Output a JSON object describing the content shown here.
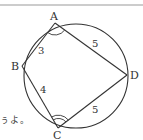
{
  "diagram": {
    "vertices": {
      "A": {
        "label": "A",
        "x": 55,
        "y": 23
      },
      "B": {
        "label": "B",
        "x": 22,
        "y": 66
      },
      "C": {
        "label": "C",
        "x": 58,
        "y": 128
      },
      "D": {
        "label": "D",
        "x": 127,
        "y": 75
      }
    },
    "sides": {
      "AB": {
        "label": "3"
      },
      "BC": {
        "label": "4"
      },
      "CD": {
        "label": "5"
      },
      "DA": {
        "label": "5"
      }
    },
    "circle": {
      "cx": 76,
      "cy": 76,
      "r": 52
    },
    "angle_marks": {
      "A": "single arc",
      "C": "double arc"
    },
    "stroke_color": "#333333"
  },
  "page": {
    "partial_text": "ぅよ。"
  }
}
